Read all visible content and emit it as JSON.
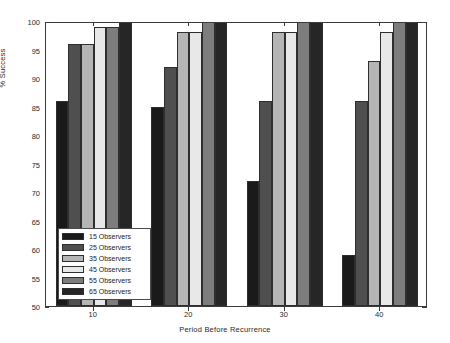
{
  "chart_data": {
    "type": "bar",
    "title": "",
    "xlabel": "Period Before Recurrence",
    "ylabel": "% Success",
    "categories": [
      "10",
      "20",
      "30",
      "40"
    ],
    "ylim": [
      50,
      100
    ],
    "yticks": [
      50,
      55,
      60,
      65,
      70,
      75,
      80,
      85,
      90,
      95,
      100
    ],
    "grid": false,
    "legend_position": "lower-left-inside",
    "series": [
      {
        "name": "15 Observers",
        "color": "#1a1a1a",
        "values": [
          86,
          85,
          72,
          59
        ]
      },
      {
        "name": "25 Observers",
        "color": "#4f4f4f",
        "values": [
          96,
          92,
          86,
          86
        ]
      },
      {
        "name": "35 Observers",
        "color": "#b5b5b5",
        "values": [
          96,
          98,
          98,
          93
        ]
      },
      {
        "name": "45 Observers",
        "color": "#e8e8e8",
        "values": [
          99,
          98,
          98,
          98
        ]
      },
      {
        "name": "55 Observers",
        "color": "#7d7d7d",
        "values": [
          99,
          100,
          100,
          100
        ]
      },
      {
        "name": "65 Observers",
        "color": "#262626",
        "values": [
          100,
          100,
          100,
          100
        ]
      }
    ]
  },
  "axes": {
    "ylabel": "% Success",
    "xlabel": "Period Before Recurrence",
    "ytick_labels": [
      "50",
      "55",
      "60",
      "65",
      "70",
      "75",
      "80",
      "85",
      "90",
      "95",
      "100"
    ],
    "xtick_labels": [
      "10",
      "20",
      "30",
      "40"
    ]
  },
  "legend": {
    "items": [
      {
        "label": "15 Observers"
      },
      {
        "label": "25 Observers"
      },
      {
        "label": "35 Observers"
      },
      {
        "label": "45 Observers"
      },
      {
        "label": "55 Observers"
      },
      {
        "label": "65 Observers"
      }
    ]
  }
}
